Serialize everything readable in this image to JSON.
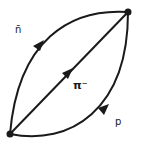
{
  "diagram": {
    "type": "feynman-loop",
    "vertices": [
      {
        "id": "v-top-right",
        "x": 128,
        "y": 12
      },
      {
        "id": "v-bottom-left",
        "x": 10,
        "y": 134
      }
    ],
    "propagators": [
      {
        "id": "nbar",
        "label": "n̄",
        "from": "v-top-right",
        "to": "v-bottom-left",
        "shape": "arc-upper-left"
      },
      {
        "id": "pi-minus",
        "label": "π⁻",
        "from": "v-bottom-left",
        "to": "v-top-right",
        "shape": "straight"
      },
      {
        "id": "proton",
        "label": "p",
        "from": "v-bottom-left",
        "to": "v-top-right",
        "shape": "arc-lower-right"
      }
    ],
    "labels": {
      "nbar": "n̄",
      "pi_minus": "π⁻",
      "proton": "p"
    },
    "colors": {
      "line": "#1a1a1a",
      "background": "#ffffff"
    }
  }
}
